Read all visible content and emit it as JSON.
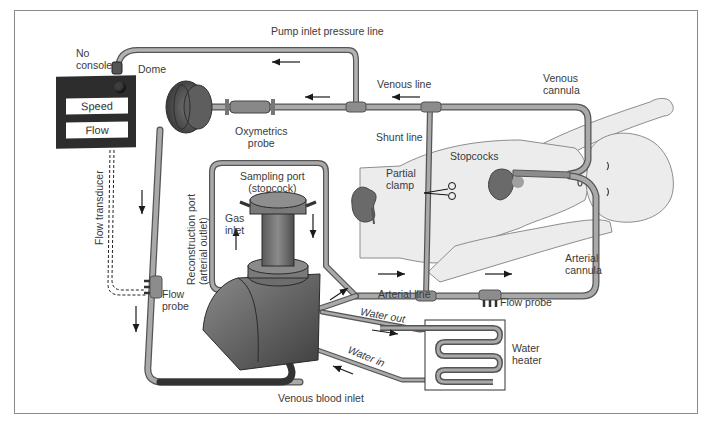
{
  "diagram": {
    "type": "ECMO / cardiopulmonary bypass circuit schematic (infant)",
    "labels": {
      "pump_inlet_pressure_line": "Pump inlet pressure line",
      "no_console": "No\nconsole",
      "dome": "Dome",
      "venous_line": "Venous line",
      "venous_cannula": "Venous\ncannula",
      "oxymetrics_probe": "Oxymetrics\nprobe",
      "shunt_line": "Shunt line",
      "stopcocks": "Stopcocks",
      "partial_clamp": "Partial\nclamp",
      "sampling_port": "Sampling port\n(stopcock)",
      "gas_inlet": "Gas\ninlet",
      "reconstruction_port": "Reconstruction port\n(arterial outlet)",
      "flow_transducer": "Flow transducer",
      "flow_probe_left": "Flow\nprobe",
      "arterial_line": "Arterial line",
      "flow_probe_right": "Flow probe",
      "arterial_cannula": "Arterial\ncannula",
      "water_out": "Water out",
      "water_in": "Water in",
      "water_heater": "Water\nheater",
      "venous_blood_inlet": "Venous blood inlet"
    },
    "console": {
      "fields": [
        "Speed",
        "Flow"
      ]
    },
    "icons": [
      "kidney-icon",
      "heart-icon",
      "scissors-clamp-icon",
      "infant-figure",
      "oxygenator-icon",
      "centrifugal-pump-dome-icon",
      "heat-exchanger-coil-icon",
      "flow-arrow-icon"
    ],
    "colors": {
      "tube_fill": "#a9a9a9",
      "tube_stroke": "#555555",
      "console": "#2d2d2d",
      "body_fill": "#ececec",
      "organ": "#6e6e6e",
      "frame": "#8a8a8a"
    }
  }
}
